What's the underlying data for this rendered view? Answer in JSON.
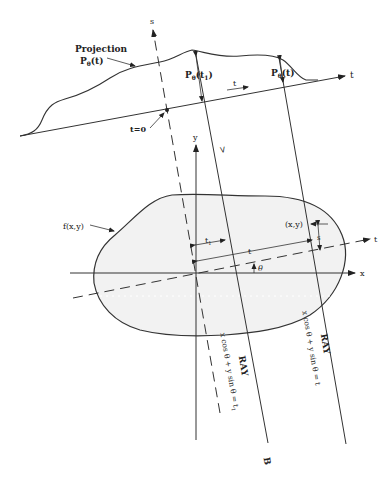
{
  "diagram": {
    "labels": {
      "s_axis": "s",
      "t_axis_top": "t",
      "t_axis_object": "t",
      "x_axis": "x",
      "y_axis": "y",
      "projection_title": "Projection",
      "projection_func": "P",
      "projection_func_sub": "θ",
      "projection_func_arg": "(t)",
      "p_t1_main": "P",
      "p_t1_sub": "θ",
      "p_t1_arg": "(t",
      "p_t1_arg_sub": "1",
      "p_t1_close": ")",
      "p_t_main": "P",
      "p_t_sub": "θ",
      "p_t_arg": "(t)",
      "t_arrow": "t",
      "t_zero": "t=0",
      "object": "f(x,y)",
      "point": "(x,y)",
      "t1_dim": "t",
      "t1_dim_sub": "1",
      "t_dim": "t",
      "s_dim": "s",
      "theta": "θ",
      "ray1_label": "RAY",
      "ray1_eq": "x cos θ + y sin θ = t",
      "ray1_eq_sub": "1",
      "ray2_label": "RAY",
      "ray2_eq": "x cos θ + y sin θ = t",
      "ray_end_B": "B",
      "ray_start_A": "A"
    },
    "colors": {
      "line": "#333333",
      "fill": "#f2f2f2",
      "background": "#ffffff"
    }
  }
}
